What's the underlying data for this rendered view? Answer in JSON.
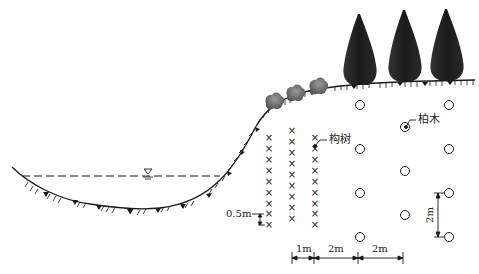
{
  "diagram": {
    "type": "riverbank-planting-cross-section",
    "labels": {
      "goushu": "构树",
      "baimu": "柏木",
      "row_spacing_small": "0.5m",
      "dim_1m": "1m",
      "dim_2m_a": "2m",
      "dim_2m_b": "2m",
      "dim_vertical_2m": "2m"
    },
    "symbols": {
      "water_level": "▽",
      "goushu_marker": "×",
      "baimu_marker": "○"
    },
    "colors": {
      "line": "#1a1a1a",
      "tree_dark": "#1c1c1c",
      "shrub": "#7a7a7a",
      "background": "#ffffff"
    },
    "elements": {
      "cypress_trees": 3,
      "shrubs": 4,
      "goushu_columns": 3,
      "baimu_columns": 3
    }
  }
}
